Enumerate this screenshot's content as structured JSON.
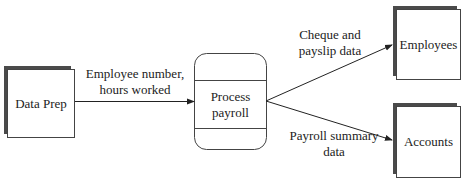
{
  "diagram": {
    "type": "data-flow-diagram",
    "nodes": [
      {
        "id": "data_prep",
        "label": "Data Prep",
        "kind": "external-entity"
      },
      {
        "id": "process_payroll",
        "label": "Process\npayroll",
        "line1": "Process",
        "line2": "payroll",
        "kind": "process"
      },
      {
        "id": "employees",
        "label": "Employees",
        "kind": "external-entity"
      },
      {
        "id": "accounts",
        "label": "Accounts",
        "kind": "external-entity"
      }
    ],
    "flows": [
      {
        "from": "data_prep",
        "to": "process_payroll",
        "line1": "Employee number,",
        "line2": "hours worked"
      },
      {
        "from": "process_payroll",
        "to": "employees",
        "line1": "Cheque and",
        "line2": "payslip data"
      },
      {
        "from": "process_payroll",
        "to": "accounts",
        "line1": "Payroll summary",
        "line2": "data"
      }
    ],
    "colors": {
      "stroke": "#333333",
      "shadow": "#555555",
      "background": "#ffffff"
    }
  }
}
